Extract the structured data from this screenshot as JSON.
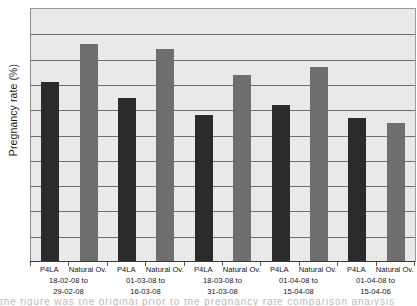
{
  "chart_data": {
    "type": "bar",
    "title": "",
    "xlabel": "",
    "ylabel": "Pregnancy rate (%)",
    "ylim": [
      0,
      100
    ],
    "grid": true,
    "gridline_count": 9,
    "legend_position": "none",
    "categories": [
      "18-02-08 to 29-02-08",
      "01-03-08 to 16-03-08",
      "18-03-08 to 31-03-08",
      "01-04-08 to 15-04-08",
      "01-04-08 to 15-04-06"
    ],
    "series": [
      {
        "name": "P4LA",
        "color": "#2b2b2b",
        "values": [
          71,
          65,
          58,
          62,
          57
        ]
      },
      {
        "name": "Natural Ov.",
        "color": "#6e6e6e",
        "values": [
          86,
          84,
          74,
          77,
          55
        ]
      }
    ],
    "bars": [
      {
        "group": 0,
        "series": "P4LA",
        "value": 71
      },
      {
        "group": 0,
        "series": "Natural Ov.",
        "value": 86
      },
      {
        "group": 1,
        "series": "P4LA",
        "value": 65
      },
      {
        "group": 1,
        "series": "Natural Ov.",
        "value": 84
      },
      {
        "group": 2,
        "series": "P4LA",
        "value": 58
      },
      {
        "group": 2,
        "series": "Natural Ov.",
        "value": 74
      },
      {
        "group": 3,
        "series": "P4LA",
        "value": 62
      },
      {
        "group": 3,
        "series": "Natural Ov.",
        "value": 77
      },
      {
        "group": 4,
        "series": "P4LA",
        "value": 57
      },
      {
        "group": 4,
        "series": "Natural Ov.",
        "value": 55
      }
    ]
  },
  "axes": {
    "y_title": "Pregnancy rate (%)"
  },
  "xaxis": {
    "groups": [
      {
        "series_labels": [
          "P4LA",
          "Natural Ov."
        ],
        "date_line1": "18-02-08 to",
        "date_line2": "29-02-08"
      },
      {
        "series_labels": [
          "P4LA",
          "Natural Ov."
        ],
        "date_line1": "01-03-08 to",
        "date_line2": "16-03-08"
      },
      {
        "series_labels": [
          "P4LA",
          "Natural Ov."
        ],
        "date_line1": "18-03-08 to",
        "date_line2": "31-03-08"
      },
      {
        "series_labels": [
          "P4LA",
          "Natural Ov."
        ],
        "date_line1": "01-04-08 to",
        "date_line2": "15-04-08"
      },
      {
        "series_labels": [
          "P4LA",
          "Natural Ov."
        ],
        "date_line1": "01-04-08 to",
        "date_line2": "15-04-06"
      }
    ]
  },
  "colors": {
    "plot_background": "#e9e9e9",
    "gridline": "#6f6f6f",
    "axis": "#3a3a3a",
    "series_p4la": "#2b2b2b",
    "series_natural": "#6e6e6e",
    "text": "#151515"
  },
  "caption_bleed": {
    "text": "the figure was the original prior to the pregnancy rate comparison analysis"
  }
}
